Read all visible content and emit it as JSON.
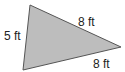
{
  "diagram": {
    "shape": "triangle",
    "fill_color": "#bdbdbd",
    "stroke_color": "#555555",
    "vertices": [
      [
        30,
        5
      ],
      [
        121,
        47
      ],
      [
        23,
        70
      ]
    ],
    "side_labels": [
      {
        "side": "left",
        "text": "5 ft"
      },
      {
        "side": "top-right",
        "text": "8 ft"
      },
      {
        "side": "bottom",
        "text": "8 ft"
      }
    ]
  }
}
